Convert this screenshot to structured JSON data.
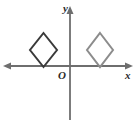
{
  "figure": {
    "background_color": "#ffffff",
    "width": 139,
    "height": 120
  },
  "axes": {
    "x_axis": {
      "label": "x",
      "color": "#6e6e6e",
      "y_pixel": 66,
      "x_start": 4,
      "x_end": 132,
      "arrow_left": true,
      "arrow_right": true
    },
    "y_axis": {
      "label": "y",
      "color": "#6e6e6e",
      "x_pixel": 70,
      "y_start": 8,
      "y_end": 120,
      "arrow_up": true,
      "arrow_down": false
    },
    "origin_label": "O"
  },
  "chart_data": {
    "type": "scatter",
    "xlabel": "x",
    "ylabel": "y",
    "grid": false,
    "legend": null,
    "origin_pixel": [
      70,
      66
    ],
    "shapes": [
      {
        "name": "left-diamond",
        "kind": "rhombus",
        "color": "#3a3a3a",
        "stroke_width": 2.0,
        "fill": "none",
        "position": "second quadrant, bottom vertex on x-axis",
        "vertices_pixels": [
          [
            43.5,
            33
          ],
          [
            57,
            50
          ],
          [
            43.5,
            67
          ],
          [
            30,
            50
          ]
        ],
        "center_pixel": [
          43.5,
          50
        ],
        "half_width_px": 13.5,
        "half_height_px": 17
      },
      {
        "name": "right-diamond",
        "kind": "rhombus",
        "color": "#8c8c8c",
        "stroke_width": 2.0,
        "fill": "none",
        "position": "first quadrant, bottom vertex on x-axis",
        "vertices_pixels": [
          [
            100,
            33
          ],
          [
            113,
            50
          ],
          [
            100,
            67
          ],
          [
            87,
            50
          ]
        ],
        "center_pixel": [
          100,
          50
        ],
        "half_width_px": 13,
        "half_height_px": 17
      }
    ],
    "annotations": [
      {
        "text": "y",
        "position_pixels": [
          66,
          11
        ],
        "style": "italic-bold"
      },
      {
        "text": "x",
        "position_pixels": [
          128,
          76
        ],
        "style": "italic-bold"
      },
      {
        "text": "O",
        "position_pixels": [
          61,
          77
        ],
        "style": "italic-bold"
      }
    ]
  }
}
